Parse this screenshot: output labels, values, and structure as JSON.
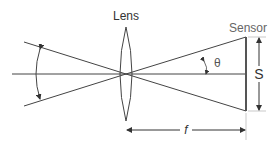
{
  "diagram": {
    "labels": {
      "lens": "Lens",
      "sensor": "Sensor",
      "angle": "θ",
      "sensor_size": "S",
      "focal_length": "f"
    },
    "colors": {
      "line": "#333333",
      "sensor_text": "#666666",
      "lens_text": "#333333",
      "guide": "#bbbbbb"
    }
  }
}
